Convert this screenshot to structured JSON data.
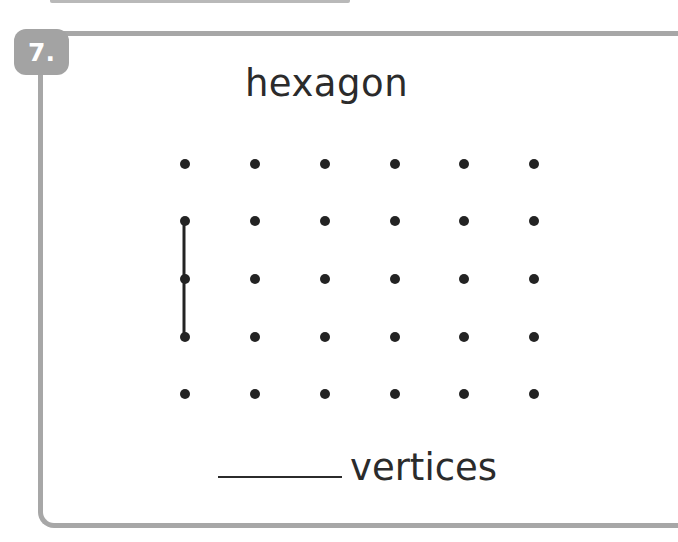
{
  "problem": {
    "number": "7.",
    "shape_name": "hexagon",
    "answer_blank": "",
    "answer_label": "vertices"
  },
  "dot_grid": {
    "columns_x": [
      185,
      255,
      325,
      395,
      464,
      534
    ],
    "rows_y": [
      164,
      221,
      279,
      337,
      394
    ],
    "dot_radius": 5,
    "dot_color": "#232323"
  },
  "drawn_segments": [
    {
      "from": [
        184,
        221
      ],
      "to": [
        184,
        279
      ]
    },
    {
      "from": [
        184,
        279
      ],
      "to": [
        184,
        337
      ]
    }
  ],
  "colors": {
    "border": "#a7a7a7",
    "badge_bg": "#a3a3a3",
    "text": "#2b2b2b"
  }
}
